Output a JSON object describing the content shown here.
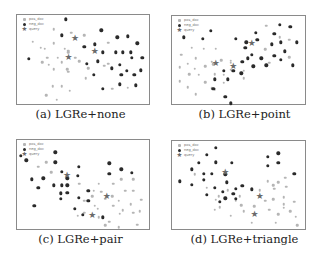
{
  "chart_data": [
    {
      "type": "scatter",
      "title": "",
      "caption": "(a) LGRe+none",
      "xlabel": "",
      "ylabel": "",
      "grid": false,
      "legend": [
        "pos_doc",
        "neg_doc",
        "query"
      ],
      "legend_position": "upper-left",
      "coords": "percent of plot frame, x from left, y from top",
      "queries": [
        [
          44,
          27
        ],
        [
          59,
          42
        ],
        [
          39,
          48
        ]
      ],
      "pos_doc": [
        [
          28,
          16
        ],
        [
          41,
          20
        ],
        [
          51,
          23
        ],
        [
          12,
          30
        ],
        [
          28,
          32
        ],
        [
          18,
          37
        ],
        [
          21,
          38
        ],
        [
          36,
          38
        ],
        [
          39,
          40
        ],
        [
          69,
          31
        ],
        [
          39,
          42
        ],
        [
          23,
          48
        ],
        [
          31,
          48
        ],
        [
          44,
          48
        ],
        [
          47,
          52
        ],
        [
          19,
          53
        ],
        [
          24,
          56
        ],
        [
          34,
          53
        ],
        [
          28,
          61
        ],
        [
          38,
          61
        ],
        [
          39,
          64
        ],
        [
          54,
          60
        ],
        [
          69,
          55
        ],
        [
          66,
          57
        ],
        [
          52,
          71
        ],
        [
          27,
          80
        ],
        [
          34,
          80
        ],
        [
          40,
          85
        ],
        [
          22,
          90
        ],
        [
          30,
          95
        ],
        [
          72,
          83
        ],
        [
          84,
          82
        ]
      ],
      "neg_doc": [
        [
          37,
          5
        ],
        [
          64,
          17
        ],
        [
          34,
          23
        ],
        [
          76,
          25
        ],
        [
          84,
          24
        ],
        [
          91,
          32
        ],
        [
          51,
          36
        ],
        [
          59,
          33
        ],
        [
          65,
          42
        ],
        [
          80,
          42
        ],
        [
          75,
          42
        ],
        [
          86,
          42
        ],
        [
          95,
          48
        ],
        [
          9,
          49
        ],
        [
          87,
          48
        ],
        [
          53,
          55
        ],
        [
          61,
          52
        ],
        [
          78,
          56
        ],
        [
          58,
          67
        ],
        [
          72,
          60
        ],
        [
          83,
          63
        ],
        [
          79,
          67
        ],
        [
          89,
          67
        ],
        [
          94,
          62
        ],
        [
          65,
          83
        ],
        [
          78,
          78
        ],
        [
          90,
          79
        ]
      ]
    },
    {
      "type": "scatter",
      "title": "",
      "caption": "(b) LGRe+point",
      "xlabel": "",
      "ylabel": "",
      "grid": false,
      "legend": [
        "pos_doc",
        "neg_doc",
        "query"
      ],
      "legend_position": "upper-left",
      "coords": "percent of plot frame, x from left, y from top",
      "queries": [
        [
          60,
          32
        ],
        [
          33,
          55
        ],
        [
          46,
          58
        ]
      ],
      "pos_doc": [
        [
          71,
          11
        ],
        [
          88,
          27
        ],
        [
          15,
          36
        ],
        [
          7,
          44
        ],
        [
          33,
          37
        ],
        [
          24,
          37
        ],
        [
          18,
          48
        ],
        [
          30,
          52
        ],
        [
          37,
          50
        ],
        [
          44,
          51
        ],
        [
          12,
          54
        ],
        [
          17,
          60
        ],
        [
          25,
          57
        ],
        [
          31,
          55
        ],
        [
          44,
          53
        ],
        [
          6,
          58
        ],
        [
          13,
          66
        ],
        [
          20,
          67
        ],
        [
          32,
          66
        ],
        [
          39,
          67
        ],
        [
          6,
          74
        ],
        [
          12,
          81
        ],
        [
          25,
          75
        ],
        [
          30,
          82
        ],
        [
          54,
          71
        ],
        [
          18,
          89
        ],
        [
          32,
          83
        ],
        [
          39,
          76
        ],
        [
          70,
          38
        ],
        [
          73,
          53
        ],
        [
          81,
          24
        ],
        [
          88,
          47
        ],
        [
          54,
          62
        ],
        [
          44,
          61
        ]
      ],
      "neg_doc": [
        [
          9,
          24
        ],
        [
          29,
          17
        ],
        [
          23,
          26
        ],
        [
          48,
          26
        ],
        [
          56,
          30
        ],
        [
          64,
          27
        ],
        [
          77,
          20
        ],
        [
          81,
          10
        ],
        [
          89,
          12
        ],
        [
          82,
          30
        ],
        [
          63,
          19
        ],
        [
          75,
          32
        ],
        [
          85,
          40
        ],
        [
          94,
          30
        ],
        [
          55,
          36
        ],
        [
          57,
          48
        ],
        [
          60,
          44
        ],
        [
          67,
          48
        ],
        [
          77,
          45
        ],
        [
          82,
          50
        ],
        [
          71,
          56
        ],
        [
          91,
          56
        ],
        [
          53,
          52
        ],
        [
          61,
          57
        ],
        [
          39,
          62
        ],
        [
          46,
          62
        ],
        [
          32,
          72
        ],
        [
          42,
          72
        ],
        [
          52,
          65
        ],
        [
          31,
          83
        ],
        [
          44,
          99
        ],
        [
          40,
          92
        ]
      ]
    },
    {
      "type": "scatter",
      "title": "",
      "caption": "(c) LGRe+pair",
      "xlabel": "",
      "ylabel": "",
      "grid": false,
      "legend": [
        "pos_doc",
        "neg_doc",
        "query"
      ],
      "legend_position": "upper-left",
      "coords": "percent of plot frame, x from left, y from top",
      "queries": [
        [
          38,
          40
        ],
        [
          57,
          85
        ],
        [
          68,
          64
        ]
      ],
      "pos_doc": [
        [
          16,
          30
        ],
        [
          22,
          25
        ],
        [
          26,
          36
        ],
        [
          47,
          49
        ],
        [
          62,
          49
        ],
        [
          73,
          49
        ],
        [
          79,
          44
        ],
        [
          88,
          44
        ],
        [
          58,
          57
        ],
        [
          64,
          58
        ],
        [
          72,
          63
        ],
        [
          82,
          57
        ],
        [
          88,
          57
        ],
        [
          94,
          67
        ],
        [
          51,
          68
        ],
        [
          67,
          66
        ],
        [
          77,
          68
        ],
        [
          86,
          72
        ],
        [
          59,
          74
        ],
        [
          73,
          74
        ],
        [
          80,
          79
        ],
        [
          93,
          80
        ],
        [
          51,
          82
        ],
        [
          78,
          83
        ],
        [
          88,
          82
        ],
        [
          62,
          87
        ],
        [
          70,
          92
        ],
        [
          91,
          95
        ],
        [
          67,
          96
        ],
        [
          77,
          98
        ],
        [
          61,
          77
        ],
        [
          57,
          63
        ],
        [
          46,
          85
        ]
      ],
      "neg_doc": [
        [
          3,
          18
        ],
        [
          7,
          23
        ],
        [
          29,
          14
        ],
        [
          29,
          25
        ],
        [
          20,
          43
        ],
        [
          34,
          36
        ],
        [
          47,
          30
        ],
        [
          34,
          51
        ],
        [
          46,
          40
        ],
        [
          70,
          26
        ],
        [
          70,
          38
        ],
        [
          79,
          33
        ],
        [
          87,
          37
        ],
        [
          11,
          44
        ],
        [
          16,
          54
        ],
        [
          13,
          74
        ],
        [
          28,
          51
        ],
        [
          38,
          51
        ],
        [
          38,
          59
        ],
        [
          33,
          66
        ],
        [
          47,
          65
        ],
        [
          54,
          57
        ],
        [
          54,
          68
        ],
        [
          44,
          77
        ],
        [
          50,
          84
        ],
        [
          65,
          87
        ],
        [
          33,
          60
        ],
        [
          38,
          43
        ]
      ]
    },
    {
      "type": "scatter",
      "title": "",
      "caption": "(d) LGRe+triangle",
      "xlabel": "",
      "ylabel": "",
      "grid": false,
      "legend": [
        "pos_doc",
        "neg_doc",
        "query"
      ],
      "legend_position": "upper-left",
      "coords": "percent of plot frame, x from left, y from top",
      "queries": [
        [
          40,
          36
        ],
        [
          62,
          84
        ],
        [
          66,
          64
        ]
      ],
      "pos_doc": [
        [
          17,
          38
        ],
        [
          24,
          45
        ],
        [
          33,
          67
        ],
        [
          26,
          53
        ],
        [
          42,
          56
        ],
        [
          36,
          75
        ],
        [
          32,
          78
        ],
        [
          48,
          68
        ],
        [
          52,
          73
        ],
        [
          66,
          56
        ],
        [
          66,
          63
        ],
        [
          70,
          68
        ],
        [
          76,
          66
        ],
        [
          77,
          54
        ],
        [
          84,
          64
        ],
        [
          85,
          42
        ],
        [
          86,
          52
        ],
        [
          92,
          69
        ],
        [
          76,
          50
        ],
        [
          80,
          47
        ],
        [
          84,
          72
        ],
        [
          54,
          80
        ],
        [
          62,
          74
        ],
        [
          73,
          78
        ],
        [
          80,
          83
        ],
        [
          89,
          80
        ],
        [
          93,
          86
        ],
        [
          94,
          96
        ],
        [
          60,
          93
        ],
        [
          78,
          93
        ],
        [
          84,
          76
        ],
        [
          44,
          85
        ],
        [
          72,
          46
        ],
        [
          35,
          63
        ],
        [
          51,
          63
        ]
      ],
      "neg_doc": [
        [
          33,
          8
        ],
        [
          26,
          16
        ],
        [
          20,
          25
        ],
        [
          33,
          24
        ],
        [
          45,
          25
        ],
        [
          72,
          18
        ],
        [
          80,
          14
        ],
        [
          72,
          28
        ],
        [
          80,
          25
        ],
        [
          92,
          37
        ],
        [
          15,
          32
        ],
        [
          24,
          37
        ],
        [
          30,
          37
        ],
        [
          40,
          38
        ],
        [
          6,
          46
        ],
        [
          15,
          50
        ],
        [
          24,
          44
        ],
        [
          32,
          53
        ],
        [
          41,
          47
        ],
        [
          48,
          54
        ],
        [
          53,
          51
        ],
        [
          60,
          55
        ],
        [
          26,
          61
        ],
        [
          38,
          58
        ],
        [
          46,
          60
        ],
        [
          48,
          66
        ],
        [
          36,
          69
        ],
        [
          40,
          65
        ]
      ]
    }
  ]
}
